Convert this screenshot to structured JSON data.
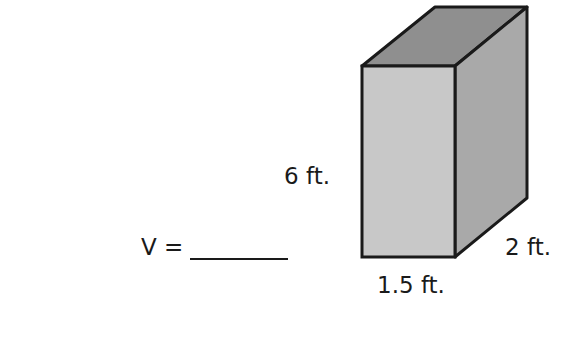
{
  "problem": {
    "prompt": "V =",
    "answer_blank": ""
  },
  "figure": {
    "shape": "rectangular-prism",
    "height_label": "6 ft.",
    "width_label": "1.5 ft.",
    "depth_label": "2 ft.",
    "colors": {
      "front": "#c8c8c8",
      "side": "#a9a9a9",
      "top": "#8f8f8f",
      "edge": "#1a1a1a"
    }
  }
}
